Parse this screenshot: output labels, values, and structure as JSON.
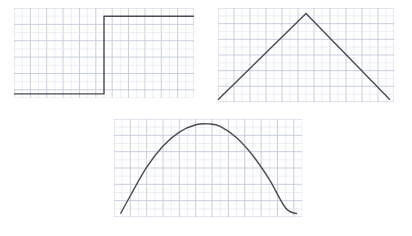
{
  "figure": {
    "title": "",
    "background_color": "#ffffff",
    "grid_minor_color": "#dfe3ec",
    "grid_major_color": "#c3c9db",
    "curve_color": "#4a4a52",
    "curve_width": 1.4
  },
  "panels": [
    {
      "id": "step",
      "name": "step-function-panel",
      "label": "",
      "grid": {
        "cols": 22,
        "rows": 11,
        "major_every": 2
      }
    },
    {
      "id": "tent",
      "name": "triangle-wave-panel",
      "label": "",
      "grid": {
        "cols": 22,
        "rows": 12,
        "major_every": 2
      }
    },
    {
      "id": "parabola",
      "name": "parabola-panel",
      "label": "",
      "grid": {
        "cols": 23,
        "rows": 12,
        "major_every": 2
      }
    }
  ],
  "chart_data": [
    {
      "type": "line",
      "id": "step",
      "title": "",
      "xlabel": "",
      "ylabel": "",
      "grid": true,
      "legend": "none",
      "xlim": [
        0,
        22
      ],
      "ylim": [
        0,
        11
      ],
      "x": [
        0,
        11,
        11,
        22
      ],
      "y": [
        0.5,
        0.5,
        10,
        10
      ],
      "description": "Step function: flat low segment, vertical jump at mid-domain, flat high segment"
    },
    {
      "type": "line",
      "id": "tent",
      "title": "",
      "xlabel": "",
      "ylabel": "",
      "grid": true,
      "legend": "none",
      "xlim": [
        0,
        22
      ],
      "ylim": [
        0,
        12
      ],
      "x": [
        0,
        11,
        21.5
      ],
      "y": [
        0.3,
        11.3,
        0.3
      ],
      "description": "Triangle (tent) wave: linear rise to an apex slightly left of center, then linear fall"
    },
    {
      "type": "line",
      "id": "parabola",
      "title": "",
      "xlabel": "",
      "ylabel": "",
      "grid": true,
      "legend": "none",
      "xlim": [
        0,
        23
      ],
      "ylim": [
        0,
        12
      ],
      "x": [
        0.8,
        2,
        4,
        6,
        8,
        10,
        11.6,
        13,
        15,
        17,
        19,
        21,
        22.4
      ],
      "y": [
        0.4,
        2.6,
        6.1,
        8.7,
        10.4,
        11.3,
        11.4,
        11.1,
        9.7,
        7.5,
        4.6,
        1.1,
        0.4
      ],
      "description": "Smooth downward-opening parabola peaking near the horizontal center"
    }
  ]
}
